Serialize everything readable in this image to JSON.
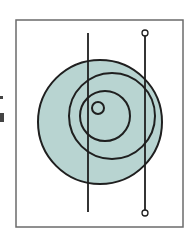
{
  "diagram": {
    "colors": {
      "frame": "#6b6b6b",
      "stroke": "#1f1f1f",
      "disc_fill": "#b8d4d1",
      "background": "#ffffff"
    },
    "frame": {
      "x": 16,
      "y": 20,
      "width": 167,
      "height": 207
    },
    "disc": {
      "cx": 100,
      "cy": 122,
      "r": 62
    },
    "rings": [
      {
        "cx": 112,
        "cy": 116,
        "r": 43
      },
      {
        "cx": 105,
        "cy": 116,
        "r": 25
      },
      {
        "cx": 98,
        "cy": 108,
        "r": 6
      }
    ],
    "lines": [
      {
        "id": "left-line",
        "x": 88,
        "y1": 33,
        "y2": 212,
        "end_markers": false
      },
      {
        "id": "right-line",
        "x": 145,
        "y1": 33,
        "y2": 213,
        "end_markers": true,
        "marker_r": 3
      }
    ]
  }
}
